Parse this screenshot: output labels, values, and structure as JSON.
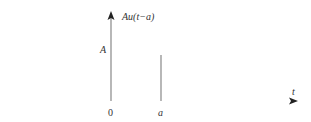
{
  "diagram": {
    "type": "shifted-step-function",
    "function_label": "Au(t−a)",
    "y_level_label": "A",
    "x_axis_label": "t",
    "x_ticks": [
      {
        "label": "0",
        "position": "origin"
      },
      {
        "label": "a",
        "position": "step-onset"
      }
    ],
    "colors": {
      "axis": "#777777",
      "step_vertical": "#888888",
      "step_top": "#6a7fc4",
      "axis_tail": "#6aa080",
      "text": "#333333"
    }
  }
}
